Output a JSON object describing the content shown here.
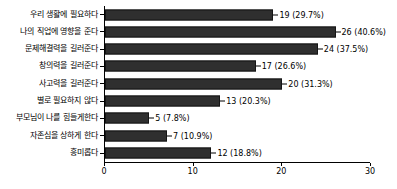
{
  "chart_data": {
    "type": "bar",
    "orientation": "horizontal",
    "title": "",
    "xlabel": "",
    "ylabel": "",
    "xlim": [
      0,
      30
    ],
    "grid": false,
    "legend": null,
    "xticks": [
      0,
      10,
      20,
      30
    ],
    "xtick_labels": [
      "0",
      "10",
      "20",
      "30"
    ],
    "bar_color": "#2f2f2f",
    "categories": [
      "우리 생활에 필요하다",
      "나의 직업에 영향을 준다",
      "문제해결력을 길러준다",
      "창의력을 길러준다",
      "사고력을 길러준다",
      "별로 필요하지 않다",
      "부모님이 나를 힘들게한다",
      "자존심을 상하게 한다",
      "흥미롭다"
    ],
    "values": [
      19,
      26,
      24,
      17,
      20,
      13,
      5,
      7,
      12
    ],
    "percents": [
      29.7,
      40.6,
      37.5,
      26.6,
      31.3,
      20.3,
      7.8,
      10.9,
      18.8
    ],
    "data_labels": [
      "19 (29.7%)",
      "26 (40.6%)",
      "24 (37.5%)",
      "17 (26.6%)",
      "20 (31.3%)",
      "13 (20.3%)",
      "5 (7.8%)",
      "7 (10.9%)",
      "12 (18.8%)"
    ]
  }
}
